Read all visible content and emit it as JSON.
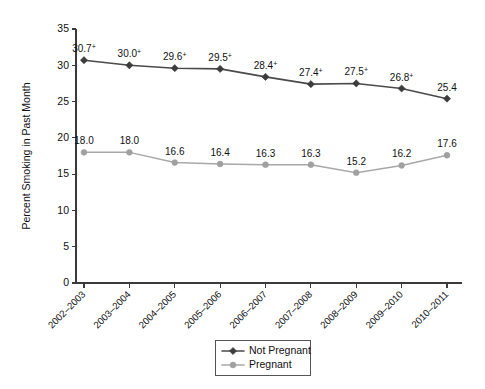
{
  "chart_data": {
    "type": "line",
    "title": "",
    "xlabel": "",
    "ylabel": "Percent Smoking in Past Month",
    "ylim": [
      0,
      35
    ],
    "yticks": [
      0,
      5,
      10,
      15,
      20,
      25,
      30,
      35
    ],
    "ytick_labels": [
      "0",
      "5",
      "10",
      "15",
      "20",
      "25",
      "30",
      "35"
    ],
    "grid": false,
    "legend_position": "bottom-center",
    "categories": [
      "2002–2003",
      "2003–2004",
      "2004–2005",
      "2005–2006",
      "2006–2007",
      "2007–2008",
      "2008–2009",
      "2009–2010",
      "2010–2011"
    ],
    "series": [
      {
        "name": "Not Pregnant",
        "color": "#3c3c3c",
        "marker": "diamond",
        "values": [
          30.7,
          30.0,
          29.6,
          29.5,
          28.4,
          27.4,
          27.5,
          26.8,
          25.4
        ],
        "point_labels": [
          "30.7",
          "30.0",
          "29.6",
          "29.5",
          "28.4",
          "27.4",
          "27.5",
          "26.8",
          "25.4"
        ],
        "point_label_marks": [
          "+",
          "+",
          "+",
          "+",
          "+",
          "+",
          "+",
          "+",
          ""
        ]
      },
      {
        "name": "Pregnant",
        "color": "#a0a0a0",
        "marker": "circle",
        "values": [
          18.0,
          18.0,
          16.6,
          16.4,
          16.3,
          16.3,
          15.2,
          16.2,
          17.6
        ],
        "point_labels": [
          "18.0",
          "18.0",
          "16.6",
          "16.4",
          "16.3",
          "16.3",
          "15.2",
          "16.2",
          "17.6"
        ],
        "point_label_marks": [
          "",
          "",
          "",
          "",
          "",
          "",
          "",
          "",
          ""
        ]
      }
    ],
    "annotations": {
      "significance_mark": "+"
    }
  },
  "legend": {
    "entries": [
      {
        "label": "Not Pregnant"
      },
      {
        "label": "Pregnant"
      }
    ]
  }
}
